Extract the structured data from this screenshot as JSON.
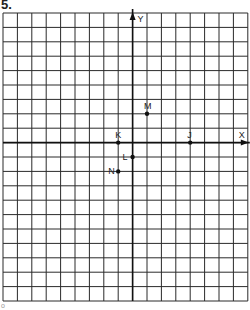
{
  "problem_number": "5.",
  "footer_mark": "o",
  "grid": {
    "origin_px": {
      "x": 3,
      "y": 13
    },
    "cell_px": 14.4,
    "cols": 17,
    "rows": 20,
    "y_axis_col": 9,
    "x_axis_row": 9,
    "line_color": "#2a2a2a",
    "axis_color": "#111111"
  },
  "axes": {
    "x_label": "X",
    "y_label": "Y"
  },
  "points": [
    {
      "label": "M",
      "x": 1,
      "y": 2,
      "label_pos": "above"
    },
    {
      "label": "K",
      "x": -1,
      "y": 0,
      "label_pos": "above"
    },
    {
      "label": "J",
      "x": 4,
      "y": 0,
      "label_pos": "above"
    },
    {
      "label": "L",
      "x": 0,
      "y": -1,
      "label_pos": "left"
    },
    {
      "label": "N",
      "x": -1,
      "y": -2,
      "label_pos": "left"
    }
  ]
}
